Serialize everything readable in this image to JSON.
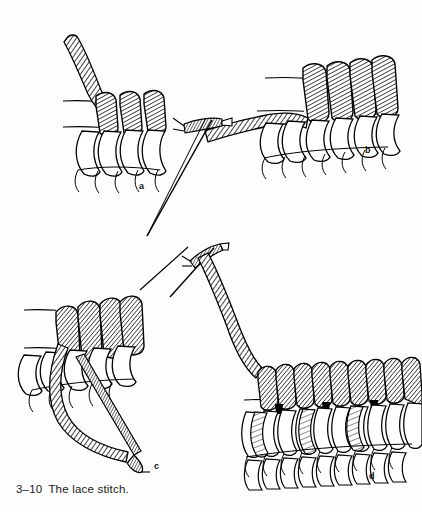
{
  "figure": {
    "caption_number": "3–10",
    "caption_text": "The lace stitch.",
    "caption_full": "3–10  The lace stitch.",
    "width": 422,
    "height": 512,
    "background_color": "#fdfdfd",
    "ink_color": "#000000",
    "style": "black-and-white line drawing / technical illustration"
  },
  "panels": [
    {
      "id": "a",
      "label": "a",
      "label_x": 139,
      "label_y": 182,
      "title": "First lace stitch coils with working thread emerging",
      "elements": [
        "twisted working cord rising to upper left",
        "three hatched vertical coils",
        "four white open loops below coils",
        "five thin curved ground lines at base",
        "two horizontal guide threads"
      ]
    },
    {
      "id": "b",
      "label": "b",
      "label_x": 365,
      "label_y": 146,
      "title": "Needle carrying thread across to the row of coils",
      "elements": [
        "threaded needle at left pointing down-left",
        "needle eye with thread loop",
        "twisted cord sweeping right into the stitch row",
        "four hatched vertical coils",
        "white open loops below",
        "thin curved ground lines at base"
      ]
    },
    {
      "id": "c",
      "label": "c",
      "label_x": 154,
      "label_y": 462,
      "title": "Needle passing down behind the coils to lock the stitch",
      "elements": [
        "four hatched vertical coils at top",
        "needle driven diagonally down-right through stitches",
        "twisted cord looping down and left",
        "white open loops",
        "thin curved ground lines"
      ]
    },
    {
      "id": "d",
      "label": "d",
      "label_x": 369,
      "label_y": 472,
      "title": "Completed row of lace stitches with needle and thread",
      "elements": [
        "threaded needle at upper left",
        "long twisted cord descending to the finished row",
        "upper row of eleven hatched coils",
        "middle row of white open loops with shaded ties",
        "lower row of partial loops",
        "thin curved ground lines"
      ]
    }
  ],
  "labels": {
    "a": "a",
    "b": "b",
    "c": "c",
    "d": "d"
  }
}
